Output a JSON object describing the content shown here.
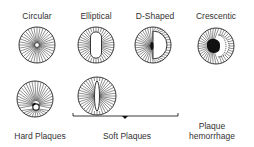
{
  "diagram": {
    "top_row": [
      {
        "id": "circular",
        "label": "Circular",
        "x": 37,
        "label_y": 12,
        "cx": 37,
        "cy": 45,
        "r": 18
      },
      {
        "id": "elliptical",
        "label": "Elliptical",
        "x": 96,
        "label_y": 12,
        "cx": 96,
        "cy": 45,
        "r": 18
      },
      {
        "id": "d-shaped",
        "label": "D-Shaped",
        "x": 155,
        "label_y": 12,
        "cx": 153,
        "cy": 45,
        "r": 18
      },
      {
        "id": "crescentic",
        "label": "Crescentic",
        "x": 216,
        "label_y": 12,
        "cx": 216,
        "cy": 46,
        "r": 18
      }
    ],
    "bottom_row": [
      {
        "id": "hard-plaques",
        "label": "Hard Plaques",
        "x": 40,
        "cx": 35,
        "cy": 99,
        "r": 18
      },
      {
        "id": "soft-plaques",
        "label": "Soft Plaques",
        "x": 127,
        "cx": 97,
        "cy": 96,
        "r": 19
      },
      {
        "id": "plaque-hemorrhage",
        "label_line1": "Plaque",
        "label_line2": "hemorrhage",
        "x": 212
      }
    ],
    "bracket": {
      "x1": 73,
      "x2": 178,
      "y": 116,
      "dot_x": 125
    },
    "colors": {
      "line": "#222222",
      "fill": "#111111",
      "background": "#ffffff"
    }
  }
}
